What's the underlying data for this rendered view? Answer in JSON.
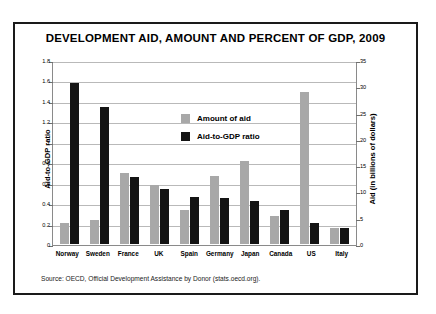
{
  "chart_data": {
    "type": "bar",
    "title": "DEVELOPMENT AID, AMOUNT AND PERCENT OF GDP, 2009",
    "categories": [
      "Norway",
      "Sweden",
      "France",
      "UK",
      "Spain",
      "Germany",
      "Japan",
      "Canada",
      "US",
      "Italy"
    ],
    "series": [
      {
        "name": "Amount of aid",
        "axis": "right",
        "color": "#a8a8a8",
        "unit": "billions of dollars",
        "values": [
          4.0,
          4.5,
          13.5,
          11.3,
          6.6,
          13.0,
          15.9,
          5.4,
          29.0,
          3.1
        ],
        "ratio_axis_equivalent": [
          0.21,
          0.24,
          0.72,
          0.6,
          0.35,
          0.7,
          0.85,
          0.29,
          1.55,
          0.165
        ]
      },
      {
        "name": "Aid-to-GDP ratio",
        "axis": "left",
        "color": "#141414",
        "unit": "percent of GDP",
        "values": [
          1.58,
          1.35,
          0.66,
          0.54,
          0.46,
          0.45,
          0.42,
          0.33,
          0.21,
          0.16
        ]
      }
    ],
    "ylabel": "Aid-to-GDP ratio",
    "ylim": [
      0,
      1.8
    ],
    "yticks": [
      "0",
      "0.2",
      "0.4",
      "0.6",
      "0.8",
      "1",
      "1.2",
      "1.4",
      "1.6",
      "1.8"
    ],
    "y2label": "Aid (in billions of dollars)",
    "y2lim": [
      0,
      35
    ],
    "y2ticks": [
      "0",
      "5",
      "10",
      "15",
      "20",
      "25",
      "30",
      "35"
    ],
    "xlabel": "",
    "grid": true,
    "legend_position": "upper center",
    "legend": [
      "Amount of aid",
      "Aid-to-GDP ratio"
    ],
    "source": "Source: OECD, Official Development Assistance by Donor (stats.oecd.org)."
  }
}
